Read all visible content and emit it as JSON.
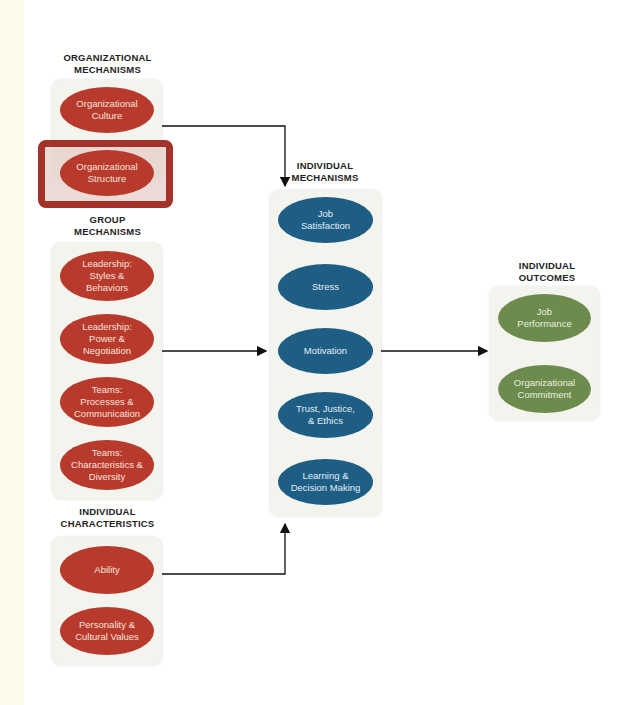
{
  "diagram": {
    "groups": {
      "organizational": {
        "heading": "ORGANIZATIONAL\nMECHANISMS",
        "items": [
          "Organizational\nCulture",
          "Organizational\nStructure"
        ],
        "highlighted": "Organizational\nStructure"
      },
      "group": {
        "heading": "GROUP\nMECHANISMS",
        "items": [
          "Leadership:\nStyles &\nBehaviors",
          "Leadership:\nPower &\nNegotiation",
          "Teams:\nProcesses &\nCommunication",
          "Teams:\nCharacteristics &\nDiversity"
        ]
      },
      "characteristics": {
        "heading": "INDIVIDUAL\nCHARACTERISTICS",
        "items": [
          "Ability",
          "Personality &\nCultural Values"
        ]
      },
      "individual": {
        "heading": "INDIVIDUAL\nMECHANISMS",
        "items": [
          "Job\nSatisfaction",
          "Stress",
          "Motivation",
          "Trust, Justice,\n& Ethics",
          "Learning &\nDecision Making"
        ]
      },
      "outcomes": {
        "heading": "INDIVIDUAL\nOUTCOMES",
        "items": [
          "Job\nPerformance",
          "Organizational\nCommitment"
        ]
      }
    },
    "colors": {
      "organizational": "#b83a2c",
      "individual": "#1e5d84",
      "outcomes": "#6e8b4e",
      "highlight": "#a3322a",
      "panel": "#f3f4ee"
    },
    "connections": [
      {
        "from": "organizational",
        "to": "individual"
      },
      {
        "from": "group",
        "to": "individual"
      },
      {
        "from": "characteristics",
        "to": "individual"
      },
      {
        "from": "individual",
        "to": "outcomes"
      }
    ]
  }
}
